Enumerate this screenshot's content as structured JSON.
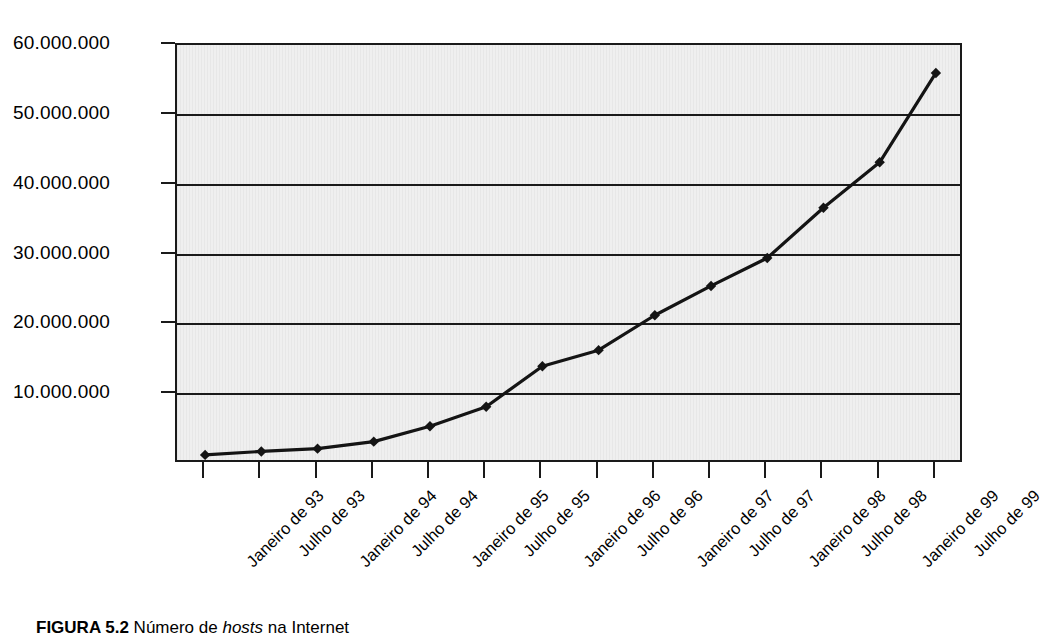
{
  "caption": {
    "label": "FIGURA 5.2",
    "text_before": " Número de ",
    "italic": "hosts",
    "text_after": " na Internet"
  },
  "chart_data": {
    "type": "line",
    "title": "",
    "subtitle": "",
    "xlabel": "",
    "ylabel": "",
    "categories": [
      "Janeiro de 93",
      "Julho de 93",
      "Janeiro de 94",
      "Julho de 94",
      "Janeiro de 95",
      "Julho de 95",
      "Janeiro de 96",
      "Julho de 96",
      "Janeiro de 97",
      "Julho de 97",
      "Janeiro de 98",
      "Julho de 98",
      "Janeiro de 99",
      "Julho de 99"
    ],
    "values": [
      1300000,
      1800000,
      2200000,
      3200000,
      5400000,
      8200000,
      14000000,
      16300000,
      21300000,
      25500000,
      29500000,
      36700000,
      43200000,
      56000000
    ],
    "series": [
      {
        "name": "Número de hosts na Internet",
        "values": [
          1300000,
          1800000,
          2200000,
          3200000,
          5400000,
          8200000,
          14000000,
          16300000,
          21300000,
          25500000,
          29500000,
          36700000,
          43200000,
          56000000
        ]
      }
    ],
    "ylim": [
      0,
      60000000
    ],
    "ytick_values": [
      10000000,
      20000000,
      30000000,
      40000000,
      50000000,
      60000000
    ],
    "ytick_labels": [
      "10.000.000",
      "20.000.000",
      "30.000.000",
      "40.000.000",
      "50.000.000",
      "60.000.000"
    ],
    "grid": true,
    "grid_axis": "y",
    "legend": false,
    "legend_position": "none",
    "marker": "diamond",
    "line_color": "#141414",
    "marker_color": "#141414",
    "plot_background": "#efefef",
    "axis_color": "#1a1a1a",
    "xtick_label_rotation": -45
  }
}
